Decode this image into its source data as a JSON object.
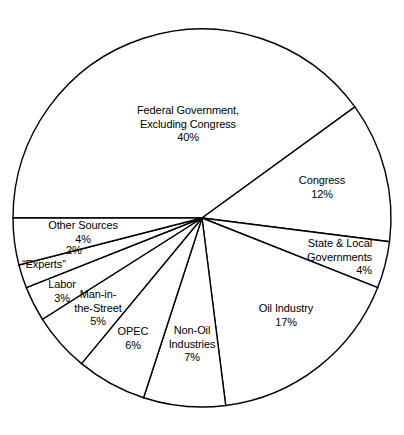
{
  "chart_data": {
    "type": "pie",
    "title": "",
    "subtitle": "",
    "xlabel": "",
    "ylabel": "",
    "legend_position": "none",
    "grid": false,
    "total": 100,
    "units": "%",
    "categories": [
      "Federal Government, Excluding Congress",
      "Congress",
      "State & Local Governments",
      "Oil Industry",
      "Non-Oil Industries",
      "OPEC",
      "Man-in-the-Street",
      "Labor",
      "“Experts”",
      "Other Sources"
    ],
    "values": [
      40,
      12,
      4,
      17,
      7,
      6,
      5,
      3,
      2,
      4
    ],
    "colors": {
      "slice_fill": "#ffffff",
      "slice_stroke": "#000000",
      "background": "#ffffff",
      "text": "#000000"
    },
    "geometry": {
      "center_x": 202,
      "center_y": 218,
      "radius": 189,
      "start_angle_deg": 180,
      "direction": "clockwise"
    }
  },
  "slices": [
    {
      "name_line1": "Federal Government,",
      "name_line2": "Excluding Congress",
      "value": "40%",
      "align": "center",
      "x": 118,
      "y": 104,
      "w": 140
    },
    {
      "name_line1": "Congress",
      "name_line2": "",
      "value": "12%",
      "align": "center",
      "x": 277,
      "y": 174,
      "w": 90
    },
    {
      "name_line1": "State & Local",
      "name_line2": "Governments",
      "value": "4%",
      "align": "right",
      "x": 258,
      "y": 237,
      "w": 114
    },
    {
      "name_line1": "Oil Industry",
      "name_line2": "",
      "value": "17%",
      "align": "center",
      "x": 238,
      "y": 302,
      "w": 96
    },
    {
      "name_line1": "Non-Oil",
      "name_line2": "Industries",
      "value": "7%",
      "align": "center",
      "x": 161,
      "y": 324,
      "w": 62
    },
    {
      "name_line1": "OPEC",
      "name_line2": "",
      "value": "6%",
      "align": "center",
      "x": 108,
      "y": 325,
      "w": 50
    },
    {
      "name_line1": "Man-in-",
      "name_line2": "the-Street",
      "value": "5%",
      "align": "center",
      "x": 64,
      "y": 288,
      "w": 68
    },
    {
      "name_line1": "Labor",
      "name_line2": "",
      "value": "3%",
      "align": "center",
      "x": 38,
      "y": 278,
      "w": 48
    },
    {
      "name_line1": "“Experts”",
      "name_line2": "",
      "value": "2%",
      "align": "left",
      "x": 22,
      "y": 258,
      "w": 66,
      "value_x": 66,
      "value_y": 244
    },
    {
      "name_line1": "Other Sources",
      "name_line2": "",
      "value": "4%",
      "align": "center",
      "x": 38,
      "y": 219,
      "w": 90
    }
  ]
}
